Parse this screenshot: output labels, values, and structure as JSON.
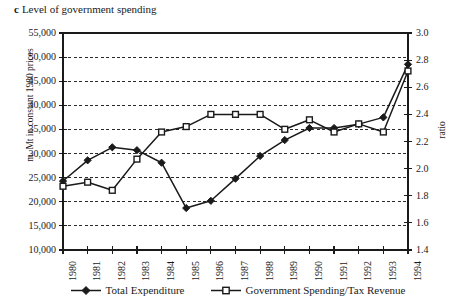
{
  "caption": {
    "letter": "c",
    "text": "Level of government spending"
  },
  "axes": {
    "left_title": "m. Mt in constant 1980 prices",
    "right_title": "ratio",
    "bottom_title": ""
  },
  "chart_data": {
    "type": "line",
    "title": "Level of government spending",
    "xlabel": "",
    "ylabel": "m. Mt in constant 1980 prices",
    "y2label": "ratio",
    "grid": true,
    "legend_position": "bottom",
    "categories": [
      "1980",
      "1981",
      "1982",
      "1983",
      "1984",
      "1985",
      "1986",
      "1987",
      "1988",
      "1989",
      "1990",
      "1991",
      "1992",
      "1993",
      "1994"
    ],
    "ylim": [
      10000,
      55000
    ],
    "yticks": [
      "10,000",
      "15,000",
      "20,000",
      "25,000",
      "30,000",
      "35,000",
      "40,000",
      "45,000",
      "50,000",
      "55,000"
    ],
    "ytick_values": [
      10000,
      15000,
      20000,
      25000,
      30000,
      35000,
      40000,
      45000,
      50000,
      55000
    ],
    "y2lim": [
      1.4,
      3.0
    ],
    "y2ticks": [
      "1.4",
      "1.6",
      "1.8",
      "2.0",
      "2.2",
      "2.4",
      "2.6",
      "2.8",
      "3.0"
    ],
    "y2tick_values": [
      1.4,
      1.6,
      1.8,
      2.0,
      2.2,
      2.4,
      2.6,
      2.8,
      3.0
    ],
    "series": [
      {
        "name": "Total Expenditure",
        "axis": "left",
        "marker": "filled-diamond",
        "values": [
          24300,
          28600,
          31300,
          30700,
          28100,
          18700,
          20200,
          24800,
          29500,
          32800,
          35300,
          35300,
          36100,
          37500,
          48500
        ]
      },
      {
        "name": "Government Spending/Tax Revenue",
        "axis": "right",
        "marker": "open-square",
        "values": [
          1.87,
          1.9,
          1.84,
          2.07,
          2.27,
          2.31,
          2.4,
          2.4,
          2.4,
          2.29,
          2.36,
          2.27,
          2.33,
          2.27,
          2.72
        ]
      }
    ]
  },
  "legend": {
    "items": [
      {
        "label": "Total Expenditure",
        "marker": "filled-diamond"
      },
      {
        "label": "Government Spending/Tax Revenue",
        "marker": "open-square"
      }
    ]
  },
  "colors": {
    "ink": "#1a1a1a",
    "grid": "#2b2b2b",
    "background": "#ffffff"
  }
}
